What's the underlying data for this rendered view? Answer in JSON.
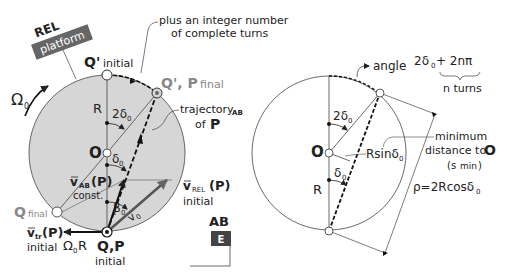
{
  "colors": {
    "platform_fill": "#d6d6d6",
    "label_box": "#666666",
    "ab_box": "#444444",
    "text": "#222222",
    "gray_text": "#888888"
  },
  "left_diagram": {
    "frame_rel": {
      "title": "REL",
      "tag": "platform"
    },
    "omega": {
      "symbol": "Ω",
      "sub": "0"
    },
    "note_turns": {
      "line1": "plus an integer number",
      "line2": "of complete turns"
    },
    "q_prime_initial": {
      "main": "Q'",
      "sub": "initial"
    },
    "q_prime_p_final": {
      "main": "Q', P",
      "sub": "final"
    },
    "trajectory": {
      "line1": "trajectory",
      "sub": "AB",
      "line2": "of",
      "bold": "P"
    },
    "R_label": "R",
    "two_delta": {
      "main": "2δ",
      "sub": "0"
    },
    "O_label": "O",
    "delta": {
      "main": "δ",
      "sub": "0"
    },
    "v_ab": {
      "main": "v",
      "sub": "AB",
      "paren": "(P)",
      "note": "const."
    },
    "beta": {
      "main": "β",
      "sub": "0"
    },
    "v0": {
      "main": "v",
      "sub": "0"
    },
    "v_rel": {
      "main": "v",
      "sub": "REL",
      "paren": "(P)",
      "note": "initial"
    },
    "q_final": {
      "main": "Q",
      "sub": "final"
    },
    "v_tr": {
      "main": "v",
      "sub": "tr",
      "paren": "(P)",
      "note": "initial"
    },
    "omega_R": {
      "main": "Ω",
      "sub": "0",
      "tail": "R"
    },
    "qp_initial": {
      "main": "Q,P",
      "note": "initial"
    },
    "frame_ab": {
      "title": "AB",
      "tag": "E"
    }
  },
  "right_diagram": {
    "angle_label": {
      "word": "angle",
      "expr1": "2δ",
      "sub": "0",
      "expr2": "+ 2nπ",
      "brace_note": "n turns"
    },
    "two_delta": {
      "main": "2δ",
      "sub": "0"
    },
    "O_label": "O",
    "rsin": {
      "main": "Rsinδ",
      "sub": "0"
    },
    "delta": {
      "main": "δ",
      "sub": "0"
    },
    "R_label": "R",
    "min_dist": {
      "line1": "minimum",
      "line2": "distance to",
      "bold": "O",
      "line3": "(s",
      "sub": "min",
      "close": ")"
    },
    "rho": {
      "main": "ρ=2Rcosδ",
      "sub": "0"
    }
  }
}
